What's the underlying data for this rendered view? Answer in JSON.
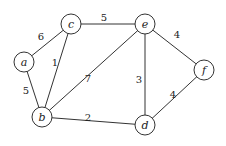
{
  "diagram": {
    "type": "weighted-undirected-graph",
    "nodes": [
      {
        "id": "a",
        "label": "a",
        "x": 24,
        "y": 62
      },
      {
        "id": "c",
        "label": "c",
        "x": 71,
        "y": 24
      },
      {
        "id": "e",
        "label": "e",
        "x": 145,
        "y": 24
      },
      {
        "id": "f",
        "label": "f",
        "x": 204,
        "y": 70
      },
      {
        "id": "b",
        "label": "b",
        "x": 42,
        "y": 117
      },
      {
        "id": "d",
        "label": "d",
        "x": 145,
        "y": 125
      }
    ],
    "edges": [
      {
        "from": "a",
        "to": "c",
        "weight": "6",
        "lx": 41,
        "ly": 36
      },
      {
        "from": "a",
        "to": "b",
        "weight": "5",
        "lx": 26,
        "ly": 90
      },
      {
        "from": "c",
        "to": "b",
        "weight": "1",
        "lx": 55,
        "ly": 62
      },
      {
        "from": "c",
        "to": "e",
        "weight": "5",
        "lx": 104,
        "ly": 17
      },
      {
        "from": "b",
        "to": "e",
        "weight": "7",
        "lx": 88,
        "ly": 78
      },
      {
        "from": "b",
        "to": "d",
        "weight": "2",
        "lx": 88,
        "ly": 117
      },
      {
        "from": "e",
        "to": "d",
        "weight": "3",
        "lx": 139,
        "ly": 79
      },
      {
        "from": "e",
        "to": "f",
        "weight": "4",
        "lx": 177,
        "ly": 34
      },
      {
        "from": "d",
        "to": "f",
        "weight": "4",
        "lx": 173,
        "ly": 94
      }
    ],
    "node_radius": 10
  }
}
